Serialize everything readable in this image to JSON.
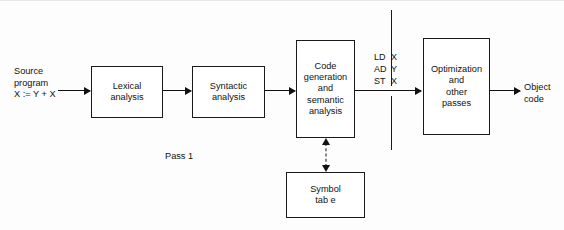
{
  "diagram": {
    "accent_color": "#111111",
    "background_color": "#fdfdfd",
    "box_border_color": "#1a1a1a"
  },
  "labels": {
    "source_program": "Source\nprogram\nX := Y + X",
    "object_code": "Object\ncode",
    "pass_marker": "Pass 1"
  },
  "boxes": {
    "lexical": "Lexical\nanalysis",
    "syntactic": "Syntactic\nanalysis",
    "codegen": "Code\ngeneration\nand\nsemantic\nanalysis",
    "optimization": "Optimization\nand\nother\npasses",
    "symbol_table": "Symbol\ntab e"
  },
  "intermediate_listing": {
    "rows": [
      {
        "op": "LD",
        "operand": "X"
      },
      {
        "op": "AD",
        "operand": "Y"
      },
      {
        "op": "ST",
        "operand": "X"
      }
    ]
  }
}
